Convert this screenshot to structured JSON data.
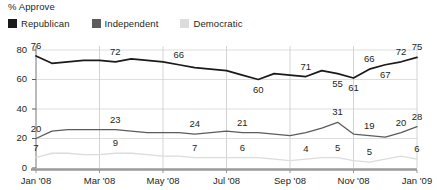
{
  "chart": {
    "axis_title": "% Approve",
    "legend": [
      {
        "label": "Republican",
        "color": "#1a1a1a",
        "icon": "square-swatch-icon"
      },
      {
        "label": "Independent",
        "color": "#5c5c5c",
        "icon": "square-swatch-icon"
      },
      {
        "label": "Democratic",
        "color": "#dcdcdc",
        "icon": "square-swatch-icon"
      }
    ]
  },
  "chart_data": {
    "type": "line",
    "title": "% Approve",
    "xlabel": "",
    "ylabel": "% Approve",
    "ylim": [
      0,
      80
    ],
    "yticks": [
      0,
      20,
      40,
      60,
      80
    ],
    "grid": "horizontal-and-vertical",
    "legend_position": "top-left",
    "x_tick_labels": [
      "Jan '08",
      "Mar '08",
      "May '08",
      "Jul '08",
      "Sep '08",
      "Nov '08",
      "Jan '09"
    ],
    "x_tick_indices": [
      0,
      4,
      8,
      12,
      16,
      20,
      24
    ],
    "x": [
      "Jan '08",
      "Jan '08b",
      "Feb '08",
      "Feb '08b",
      "Mar '08",
      "Mar '08b",
      "Apr '08",
      "Apr '08b",
      "May '08",
      "May '08b",
      "Jun '08",
      "Jun '08b",
      "Jul '08",
      "Jul '08b",
      "Aug '08",
      "Aug '08b",
      "Sep '08",
      "Sep '08b",
      "Oct '08",
      "Oct '08b",
      "Nov '08",
      "Nov '08b",
      "Dec '08",
      "Dec '08b",
      "Jan '09"
    ],
    "series": [
      {
        "name": "Republican",
        "color": "#1a1a1a",
        "values": [
          76,
          71,
          72,
          73,
          73,
          72,
          74,
          73,
          72,
          70,
          68,
          67,
          66,
          63,
          60,
          64,
          63,
          62,
          66,
          64,
          61,
          67,
          70,
          72,
          75
        ],
        "point_labels": [
          {
            "index": 0,
            "value": 76,
            "position": "above"
          },
          {
            "index": 5,
            "value": 72,
            "position": "above"
          },
          {
            "index": 9,
            "value": 66,
            "position": "above"
          },
          {
            "index": 14,
            "value": 60,
            "position": "below"
          },
          {
            "index": 17,
            "value": 71,
            "position": "above"
          },
          {
            "index": 19,
            "value": 55,
            "position": "below"
          },
          {
            "index": 20,
            "value": 61,
            "position": "below"
          },
          {
            "index": 21,
            "value": 66,
            "position": "above"
          },
          {
            "index": 22,
            "value": 67,
            "position": "below"
          },
          {
            "index": 23,
            "value": 72,
            "position": "above"
          },
          {
            "index": 24,
            "value": 75,
            "position": "above"
          }
        ]
      },
      {
        "name": "Independent",
        "color": "#5c5c5c",
        "values": [
          20,
          25,
          26,
          26,
          26,
          26,
          25,
          24,
          24,
          24,
          23,
          24,
          25,
          24,
          24,
          23,
          22,
          24,
          27,
          31,
          23,
          22,
          21,
          24,
          28
        ],
        "point_labels": [
          {
            "index": 0,
            "value": 20,
            "position": "above"
          },
          {
            "index": 5,
            "value": 23,
            "position": "above"
          },
          {
            "index": 10,
            "value": 24,
            "position": "above"
          },
          {
            "index": 13,
            "value": 21,
            "position": "above"
          },
          {
            "index": 19,
            "value": 31,
            "position": "above"
          },
          {
            "index": 21,
            "value": 19,
            "position": "above"
          },
          {
            "index": 23,
            "value": 20,
            "position": "above"
          },
          {
            "index": 24,
            "value": 28,
            "position": "above"
          }
        ]
      },
      {
        "name": "Democratic",
        "color": "#dcdcdc",
        "values": [
          7,
          10,
          10,
          9,
          9,
          10,
          10,
          9,
          8,
          8,
          7,
          7,
          7,
          7,
          7,
          6,
          5,
          6,
          7,
          7,
          5,
          4,
          6,
          8,
          6
        ],
        "point_labels": [
          {
            "index": 0,
            "value": 7,
            "position": "above"
          },
          {
            "index": 5,
            "value": 9,
            "position": "above"
          },
          {
            "index": 10,
            "value": 7,
            "position": "above"
          },
          {
            "index": 13,
            "value": 6,
            "position": "above"
          },
          {
            "index": 17,
            "value": 4,
            "position": "above"
          },
          {
            "index": 19,
            "value": 5,
            "position": "above"
          },
          {
            "index": 21,
            "value": 5,
            "position": "above"
          },
          {
            "index": 24,
            "value": 6,
            "position": "above"
          }
        ]
      }
    ]
  }
}
